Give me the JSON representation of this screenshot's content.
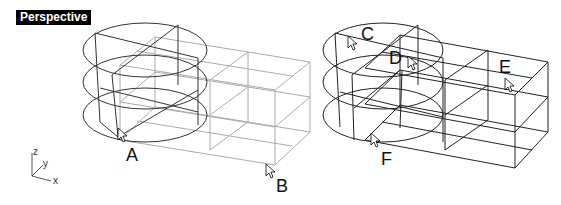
{
  "viewport": {
    "title": "Perspective"
  },
  "axes": {
    "z": "z",
    "y": "y",
    "x": "x"
  },
  "labels": {
    "A": "A",
    "B": "B",
    "C": "C",
    "D": "D",
    "E": "E",
    "F": "F"
  },
  "colors": {
    "wire_dark": "#222222",
    "wire_gray": "#aaaaaa",
    "background": "#ffffff"
  }
}
